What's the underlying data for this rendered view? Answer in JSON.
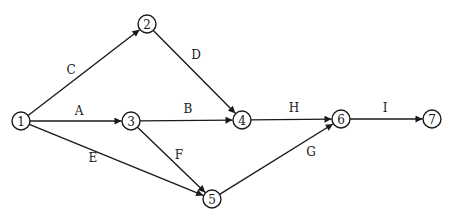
{
  "diagram": {
    "type": "activity-on-arrow network",
    "node_radius": 9,
    "colors": {
      "stroke": "#1a1a1a",
      "node_fill": "#ffffff",
      "background": "#ffffff"
    },
    "nodes": [
      {
        "id": "1",
        "label": "1",
        "x": 21,
        "y": 121
      },
      {
        "id": "2",
        "label": "2",
        "x": 147,
        "y": 24
      },
      {
        "id": "3",
        "label": "3",
        "x": 131,
        "y": 121
      },
      {
        "id": "4",
        "label": "4",
        "x": 242,
        "y": 120
      },
      {
        "id": "5",
        "label": "5",
        "x": 212,
        "y": 199
      },
      {
        "id": "6",
        "label": "6",
        "x": 341,
        "y": 119
      },
      {
        "id": "7",
        "label": "7",
        "x": 432,
        "y": 119
      }
    ],
    "edges": [
      {
        "label": "C",
        "from": "1",
        "to": "2",
        "label_x": 71,
        "label_y": 70
      },
      {
        "label": "A",
        "from": "1",
        "to": "3",
        "label_x": 79,
        "label_y": 111
      },
      {
        "label": "E",
        "from": "1",
        "to": "5",
        "label_x": 93,
        "label_y": 158
      },
      {
        "label": "D",
        "from": "2",
        "to": "4",
        "label_x": 196,
        "label_y": 55
      },
      {
        "label": "B",
        "from": "3",
        "to": "4",
        "label_x": 188,
        "label_y": 109
      },
      {
        "label": "F",
        "from": "3",
        "to": "5",
        "label_x": 179,
        "label_y": 155
      },
      {
        "label": "H",
        "from": "4",
        "to": "6",
        "label_x": 294,
        "label_y": 108
      },
      {
        "label": "G",
        "from": "5",
        "to": "6",
        "label_x": 311,
        "label_y": 152
      },
      {
        "label": "I",
        "from": "6",
        "to": "7",
        "label_x": 385,
        "label_y": 108
      }
    ]
  }
}
